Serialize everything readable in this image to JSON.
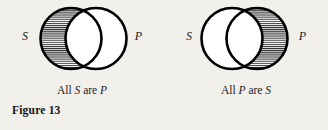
{
  "figure": {
    "number_label": "Figure 13",
    "diagrams": [
      {
        "id": "all-s-are-p",
        "left_term": "S",
        "right_term": "P",
        "caption_prefix": "All ",
        "caption_subject": "S",
        "caption_middle": " are ",
        "caption_predicate": "P",
        "caption_full": "All S are P",
        "shaded_region": "left-crescent",
        "shading_style": "horizontal-hatch"
      },
      {
        "id": "all-p-are-s",
        "left_term": "S",
        "right_term": "P",
        "caption_prefix": "All ",
        "caption_subject": "P",
        "caption_middle": " are ",
        "caption_predicate": "S",
        "caption_full": "All P are S",
        "shaded_region": "right-crescent",
        "shading_style": "horizontal-hatch"
      }
    ]
  },
  "colors": {
    "paper": "#f2f0eb",
    "ink": "#1b1b1b",
    "stroke": "#000000",
    "hatch": "#2a2a2a"
  }
}
